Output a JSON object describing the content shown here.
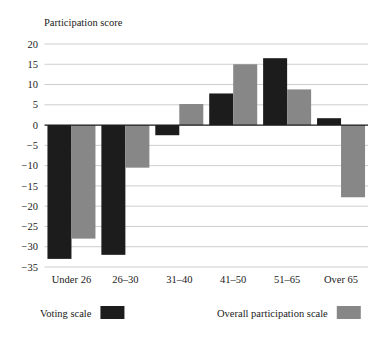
{
  "chart_data": {
    "type": "bar",
    "title": "Participation score",
    "xlabel": "",
    "ylabel": "Participation score",
    "categories": [
      "Under 26",
      "26–30",
      "31–40",
      "41–50",
      "51–65",
      "Over 65"
    ],
    "series": [
      {
        "name": "Voting scale",
        "color": "#1c1c1c",
        "values": [
          -33.0,
          -32.0,
          -2.5,
          7.8,
          16.5,
          1.7
        ]
      },
      {
        "name": "Overall participation scale",
        "color": "#878787",
        "values": [
          -28.0,
          -10.5,
          5.2,
          15.0,
          8.8,
          -17.8
        ]
      }
    ],
    "ylim": [
      -35,
      20
    ],
    "yticks": [
      20,
      15,
      10,
      5,
      0,
      -5,
      -10,
      -15,
      -20,
      -25,
      -30,
      -35
    ],
    "ytick_labels": [
      "20",
      "15",
      "10",
      "5",
      "0",
      "−5",
      "−10",
      "−15",
      "−20",
      "−25",
      "−30",
      "−35"
    ],
    "grid": true,
    "legend_position": "bottom",
    "legend": [
      {
        "label": "Voting scale",
        "color": "#1c1c1c"
      },
      {
        "label": "Overall participation scale",
        "color": "#878787"
      }
    ],
    "colors": {
      "voting_scale": "#1c1c1c",
      "overall_participation_scale": "#878787",
      "gridline": "#b9b9b9",
      "axis": "#1a1a1a",
      "background": "#ffffff"
    }
  }
}
